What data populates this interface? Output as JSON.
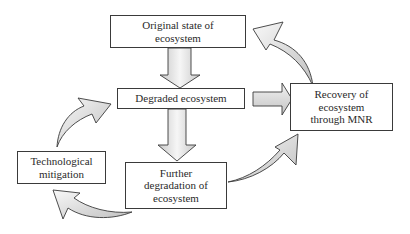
{
  "diagram": {
    "title": "",
    "nodes": [
      {
        "id": "original",
        "label": "Original state of\necosystem"
      },
      {
        "id": "degraded",
        "label": "Degraded ecosystem"
      },
      {
        "id": "further",
        "label": "Further\ndegradation of\necosystem"
      },
      {
        "id": "recovery",
        "label": "Recovery of\necosystem\nthrough MNR"
      },
      {
        "id": "technological",
        "label": "Technological\nmitigation"
      }
    ],
    "edges": [
      {
        "from": "original",
        "to": "degraded",
        "style": "block-arrow-down"
      },
      {
        "from": "degraded",
        "to": "further",
        "style": "block-arrow-down"
      },
      {
        "from": "degraded",
        "to": "recovery",
        "style": "block-arrow-right"
      },
      {
        "from": "recovery",
        "to": "original",
        "style": "curved-arrow"
      },
      {
        "from": "further",
        "to": "recovery",
        "style": "curved-arrow"
      },
      {
        "from": "further",
        "to": "technological",
        "style": "curved-arrow"
      },
      {
        "from": "technological",
        "to": "degraded",
        "style": "curved-arrow"
      }
    ],
    "colors": {
      "stroke": "#3a3a3a",
      "arrow_fill_light": "#f4f4f4",
      "arrow_fill_dark": "#c4c4c4",
      "text": "#2a2a2a"
    }
  }
}
